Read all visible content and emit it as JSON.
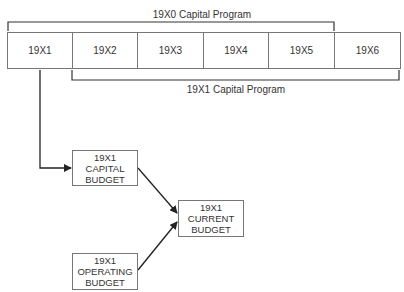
{
  "diagram": {
    "top_bracket_label": "19X0 Capital Program",
    "bottom_bracket_label": "19X1 Capital Program",
    "years": [
      "19X1",
      "19X2",
      "19X3",
      "19X4",
      "19X5",
      "19X6"
    ],
    "nodes": {
      "capital_budget": {
        "line1": "19X1",
        "line2": "CAPITAL",
        "line3": "BUDGET"
      },
      "current_budget": {
        "line1": "19X1",
        "line2": "CURRENT",
        "line3": "BUDGET"
      },
      "operating_budget": {
        "line1": "19X1",
        "line2": "OPERATING",
        "line3": "BUDGET"
      }
    },
    "edges": [
      {
        "from": "year-19X1",
        "to": "capital_budget"
      },
      {
        "from": "capital_budget",
        "to": "current_budget"
      },
      {
        "from": "operating_budget",
        "to": "current_budget"
      }
    ],
    "line_color": "#222222",
    "box_border_color": "#777777"
  }
}
